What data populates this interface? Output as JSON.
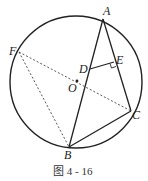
{
  "figure": {
    "caption": "图 4 - 16",
    "points": {
      "A": {
        "label": "A",
        "x": 103,
        "y": 20
      },
      "B": {
        "label": "B",
        "x": 69,
        "y": 145
      },
      "C": {
        "label": "C",
        "x": 131,
        "y": 110
      },
      "D": {
        "label": "D",
        "x": 90,
        "y": 69
      },
      "E": {
        "label": "E",
        "x": 114,
        "y": 63
      },
      "F": {
        "label": "F",
        "x": 19,
        "y": 52
      },
      "O": {
        "label": "O",
        "x": 76,
        "y": 84
      }
    },
    "circle": {
      "cx": 76,
      "cy": 82,
      "r": 66
    },
    "solid_segments": [
      "AB",
      "AC",
      "BC",
      "DE"
    ],
    "dashed_segments": [
      "FB",
      "FC"
    ],
    "right_angle_at": "E"
  }
}
